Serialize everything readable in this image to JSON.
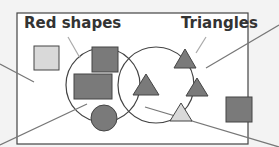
{
  "diagram": {
    "type": "venn",
    "sets": [
      {
        "label": "Red shapes"
      },
      {
        "label": "Triangles"
      }
    ],
    "colors": {
      "background": "#f3f3f3",
      "frame": "#ffffff",
      "outline": "#444444",
      "dark_fill": "#7a7a7a",
      "light_fill": "#d9d9d9",
      "pointer": "#777777"
    }
  }
}
